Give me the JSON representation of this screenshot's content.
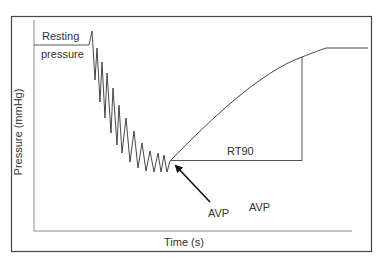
{
  "diagram": {
    "title": "",
    "ylabel": "Pressure (mmHg)",
    "xlabel": "Time (s)",
    "annotations": {
      "resting_line1": "Resting",
      "resting_line2": "pressure",
      "rt90": "RT90",
      "avp_arrow": "AVP",
      "avp_second": "AVP"
    },
    "colors": {
      "frame": "#444444",
      "axis": "#888888",
      "trace": "#333333",
      "arrow": "#111111",
      "text": "#333333"
    },
    "phases": [
      "Resting pressure baseline",
      "Oscillating pressure decline",
      "Anal verge / AVP point",
      "Recovery curve to plateau",
      "RT90 recovery time interval"
    ]
  }
}
